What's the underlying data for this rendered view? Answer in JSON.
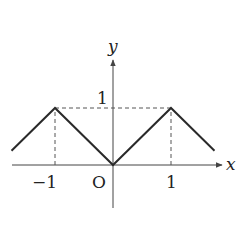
{
  "figure": {
    "type": "function-graph",
    "axes": {
      "x_label": "x",
      "y_label": "y",
      "origin_label": "O",
      "x_ticks": [
        {
          "value": -1,
          "label": "−1"
        },
        {
          "value": 1,
          "label": "1"
        }
      ],
      "y_ticks": [
        {
          "value": 1,
          "label": "1"
        }
      ]
    },
    "polyline_points": [
      [
        -1.75,
        0.25
      ],
      [
        -1,
        1
      ],
      [
        0,
        0
      ],
      [
        1,
        1
      ],
      [
        1.75,
        0.25
      ]
    ],
    "guides": [
      {
        "from": [
          -1,
          0
        ],
        "to": [
          -1,
          1
        ],
        "style": "dashed"
      },
      {
        "from": [
          1,
          0
        ],
        "to": [
          1,
          1
        ],
        "style": "dashed"
      },
      {
        "from": [
          -1,
          1
        ],
        "to": [
          1,
          1
        ],
        "style": "dashed"
      }
    ],
    "colors": {
      "line": "#2a2a2a",
      "axis": "#444444",
      "dash": "#555555"
    }
  }
}
